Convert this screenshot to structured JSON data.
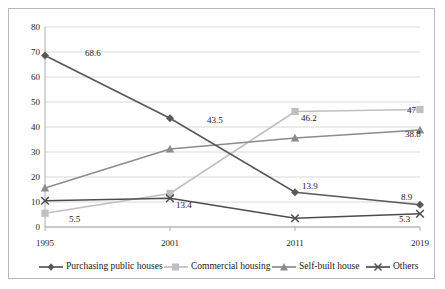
{
  "chart_data": {
    "type": "line",
    "title": "",
    "xlabel": "",
    "ylabel": "",
    "categories": [
      "1995",
      "2001",
      "2011",
      "2019"
    ],
    "ylim": [
      0,
      80
    ],
    "yticks": [
      0,
      10,
      20,
      30,
      40,
      50,
      60,
      70,
      80
    ],
    "grid": true,
    "legend_position": "bottom",
    "series": [
      {
        "name": "Purchasing public houses",
        "marker": "diamond",
        "color": "#595959",
        "values": [
          68.6,
          43.5,
          13.9,
          8.9
        ],
        "labels": [
          "68.6",
          "43.5",
          "13.9",
          "8.9"
        ]
      },
      {
        "name": "Commercial housing",
        "marker": "square",
        "color": "#bfbfbf",
        "values": [
          5.5,
          13.4,
          46.2,
          47
        ],
        "labels": [
          "5.5",
          "13.4",
          "46.2",
          "47"
        ]
      },
      {
        "name": "Self-built house",
        "marker": "triangle",
        "color": "#8c8c8c",
        "values": [
          15.6,
          31.2,
          35.6,
          38.8
        ],
        "labels": [
          "",
          "",
          "",
          "38.8"
        ]
      },
      {
        "name": "Others",
        "marker": "x",
        "color": "#4d4d4d",
        "values": [
          10.5,
          11.5,
          3.5,
          5.3
        ],
        "labels": [
          "",
          "",
          "",
          "5.3"
        ]
      }
    ]
  },
  "yticks_text": {
    "t0": "0",
    "t1": "10",
    "t2": "20",
    "t3": "30",
    "t4": "40",
    "t5": "50",
    "t6": "60",
    "t7": "70",
    "t8": "80"
  },
  "xticks_text": {
    "x0": "1995",
    "x1": "2001",
    "x2": "2011",
    "x3": "2019"
  },
  "datalabels": {
    "pub_1995": "68.6",
    "pub_2001": "43.5",
    "pub_2011": "13.9",
    "pub_2019": "8.9",
    "com_1995": "5.5",
    "com_2001": "13.4",
    "com_2011": "46.2",
    "com_2019": "47",
    "self_2019": "38.8",
    "oth_2019": "5.3"
  },
  "legend": {
    "item0": "Purchasing public houses",
    "item1": "Commercial housing",
    "item2": "Self-built house",
    "item3": "Others"
  },
  "colors": {
    "purchasing": "#595959",
    "commercial": "#bfbfbf",
    "selfbuilt": "#8c8c8c",
    "others": "#4d4d4d",
    "grid": "#c9c9c9",
    "frame": "#b9b9b9"
  }
}
